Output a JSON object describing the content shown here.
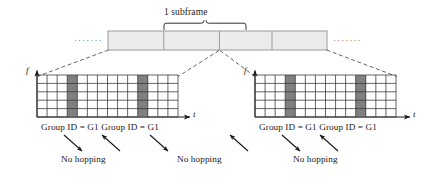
{
  "figure": {
    "type": "timing-resource-grid-diagram",
    "subframe_label": "1 subframe",
    "ellipsis_left": "·······",
    "ellipsis_right": "·······"
  },
  "subframe_bar": {
    "segment_count": 4,
    "fill_color": "#ececec",
    "stroke_color": "#9a9a9a",
    "segments": [
      {
        "index": 1,
        "label": ""
      },
      {
        "index": 2,
        "label": ""
      },
      {
        "index": 3,
        "label": ""
      },
      {
        "index": 4,
        "label": ""
      }
    ]
  },
  "grids": [
    {
      "id": "left-grid",
      "columns": 14,
      "rows": 5,
      "shaded_columns": [
        4,
        11
      ],
      "shade_color": "#808080",
      "cell_color": "#ffffff",
      "axis_f": "f",
      "axis_t": "t",
      "caption": "Group ID = G1 Group ID = G1"
    },
    {
      "id": "right-grid",
      "columns": 14,
      "rows": 5,
      "shaded_columns": [
        4,
        11
      ],
      "shade_color": "#808080",
      "cell_color": "#ffffff",
      "axis_f": "f",
      "axis_t": "t",
      "caption": "Group ID = G1 Group ID = G1"
    }
  ],
  "annotations": {
    "no_hopping_label": "No hopping",
    "no_hopping_items": [
      {
        "index": 1,
        "text": "No hopping"
      },
      {
        "index": 2,
        "text": "No hopping"
      },
      {
        "index": 3,
        "text": "No hopping"
      }
    ]
  },
  "colors": {
    "line": "#1a1a1a",
    "bar_fill": "#ececec",
    "bar_stroke": "#9a9a9a",
    "grid_stroke": "#333333",
    "shade": "#808080",
    "dashed": "#4d4d4d"
  }
}
